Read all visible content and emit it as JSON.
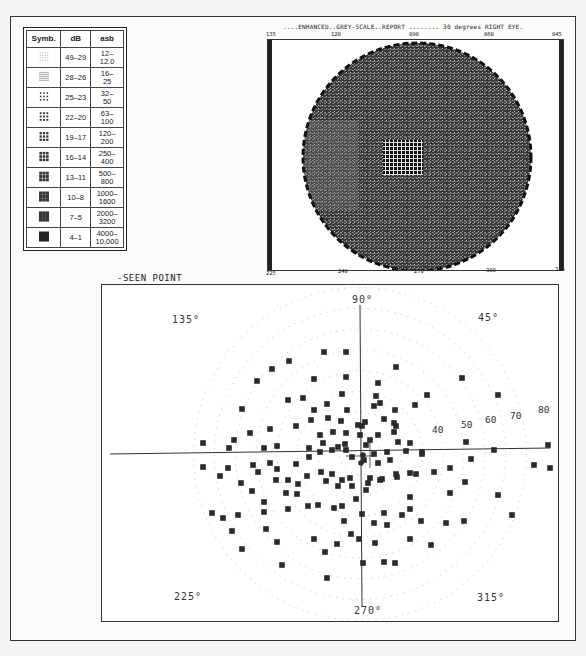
{
  "legend": {
    "headers": [
      "Symb.",
      "dB",
      "asb"
    ],
    "rows": [
      {
        "db": "49–29",
        "asb": "12–\n12.0",
        "density": 1
      },
      {
        "db": "28–26",
        "asb": "16–\n25",
        "density": 2
      },
      {
        "db": "25–23",
        "asb": "32–\n50",
        "density": 3
      },
      {
        "db": "22–20",
        "asb": "63–\n100",
        "density": 4
      },
      {
        "db": "19–17",
        "asb": "120–\n200",
        "density": 5
      },
      {
        "db": "16–14",
        "asb": "250–\n400",
        "density": 6
      },
      {
        "db": "13–11",
        "asb": "500–\n800",
        "density": 7
      },
      {
        "db": "10–8",
        "asb": "1000–\n1600",
        "density": 8
      },
      {
        "db": "7–5",
        "asb": "2000–\n3200",
        "density": 9
      },
      {
        "db": "4–1",
        "asb": "4000–\n10,000",
        "density": 10
      }
    ]
  },
  "greyscale": {
    "title": "....ENHANCED..GREY-SCALE..REPORT ........   30 degrees   RIGHT EYE.",
    "top_ticks": [
      "135",
      "120",
      "090",
      "060",
      "045"
    ],
    "bottom_ticks": [
      "225",
      "240",
      "270",
      "300",
      "315"
    ]
  },
  "status_legend": {
    "line1": "-SEEN POINT",
    "line2": "+MISSED AT  1000  I-4e",
    "line3": "●MISSED AT  3200  II-4e",
    "line4": "■MISSED AT  10000III-4e"
  },
  "colors": {
    "ink": "#222222",
    "marker": "#2a2a2a",
    "dots": "#9a9a9a"
  },
  "chart_data": {
    "type": "scatter",
    "title": "Two Zone Threshold",
    "coordinate_system": "polar",
    "angle_labels": [
      "90°",
      "45°",
      "135°",
      "225°",
      "270°",
      "315°"
    ],
    "ring_labels": [
      "40",
      "50",
      "60",
      "70",
      "80"
    ],
    "rings_deg": [
      10,
      20,
      30,
      40,
      50,
      60,
      70,
      80
    ],
    "center_px": [
      358,
      452
    ],
    "px_per_10deg": 40,
    "series": [
      {
        "name": "Missed at 10000 III-4e (square)",
        "points_px": [
          [
            322,
            350
          ],
          [
            344,
            350
          ],
          [
            287,
            359
          ],
          [
            270,
            367
          ],
          [
            255,
            379
          ],
          [
            312,
            377
          ],
          [
            344,
            375
          ],
          [
            394,
            365
          ],
          [
            425,
            393
          ],
          [
            460,
            376
          ],
          [
            496,
            393
          ],
          [
            376,
            381
          ],
          [
            374,
            394
          ],
          [
            286,
            398
          ],
          [
            240,
            407
          ],
          [
            301,
            396
          ],
          [
            312,
            408
          ],
          [
            325,
            402
          ],
          [
            340,
            392
          ],
          [
            345,
            408
          ],
          [
            372,
            404
          ],
          [
            378,
            401
          ],
          [
            393,
            408
          ],
          [
            413,
            403
          ],
          [
            392,
            421
          ],
          [
            394,
            424
          ],
          [
            382,
            417
          ],
          [
            356,
            423
          ],
          [
            360,
            424
          ],
          [
            363,
            420
          ],
          [
            339,
            419
          ],
          [
            326,
            416
          ],
          [
            309,
            418
          ],
          [
            294,
            424
          ],
          [
            268,
            427
          ],
          [
            248,
            431
          ],
          [
            232,
            438
          ],
          [
            262,
            446
          ],
          [
            275,
            444
          ],
          [
            307,
            446
          ],
          [
            321,
            441
          ],
          [
            336,
            445
          ],
          [
            343,
            442
          ],
          [
            364,
            443
          ],
          [
            368,
            438
          ],
          [
            358,
            433
          ],
          [
            344,
            431
          ],
          [
            331,
            430
          ],
          [
            318,
            433
          ],
          [
            376,
            433
          ],
          [
            392,
            430
          ],
          [
            396,
            440
          ],
          [
            408,
            441
          ],
          [
            420,
            450
          ],
          [
            404,
            449
          ],
          [
            385,
            450
          ],
          [
            372,
            452
          ],
          [
            464,
            440
          ],
          [
            492,
            448
          ],
          [
            546,
            443
          ],
          [
            201,
            441
          ],
          [
            227,
            446
          ],
          [
            201,
            465
          ],
          [
            226,
            466
          ],
          [
            251,
            463
          ],
          [
            268,
            461
          ],
          [
            275,
            467
          ],
          [
            294,
            462
          ],
          [
            307,
            455
          ],
          [
            318,
            450
          ],
          [
            330,
            448
          ],
          [
            344,
            448
          ],
          [
            350,
            455
          ],
          [
            362,
            458
          ],
          [
            376,
            461
          ],
          [
            388,
            458
          ],
          [
            394,
            472
          ],
          [
            380,
            477
          ],
          [
            368,
            476
          ],
          [
            348,
            476
          ],
          [
            340,
            478
          ],
          [
            330,
            472
          ],
          [
            319,
            470
          ],
          [
            305,
            474
          ],
          [
            296,
            482
          ],
          [
            286,
            478
          ],
          [
            274,
            478
          ],
          [
            256,
            470
          ],
          [
            239,
            481
          ],
          [
            218,
            474
          ],
          [
            250,
            489
          ],
          [
            262,
            500
          ],
          [
            284,
            491
          ],
          [
            295,
            492
          ],
          [
            324,
            479
          ],
          [
            336,
            484
          ],
          [
            350,
            484
          ],
          [
            366,
            481
          ],
          [
            378,
            478
          ],
          [
            395,
            475
          ],
          [
            408,
            471
          ],
          [
            420,
            452
          ],
          [
            414,
            472
          ],
          [
            432,
            470
          ],
          [
            448,
            466
          ],
          [
            448,
            491
          ],
          [
            463,
            480
          ],
          [
            469,
            457
          ],
          [
            532,
            463
          ],
          [
            548,
            466
          ],
          [
            496,
            493
          ],
          [
            408,
            495
          ],
          [
            364,
            488
          ],
          [
            354,
            497
          ],
          [
            340,
            504
          ],
          [
            332,
            506
          ],
          [
            316,
            503
          ],
          [
            306,
            504
          ],
          [
            286,
            507
          ],
          [
            262,
            510
          ],
          [
            230,
            529
          ],
          [
            236,
            513
          ],
          [
            360,
            512
          ],
          [
            382,
            511
          ],
          [
            408,
            507
          ],
          [
            419,
            519
          ],
          [
            385,
            523
          ],
          [
            373,
            541
          ],
          [
            444,
            521
          ],
          [
            510,
            513
          ],
          [
            221,
            516
          ],
          [
            240,
            547
          ],
          [
            210,
            511
          ],
          [
            264,
            527
          ],
          [
            275,
            540
          ],
          [
            312,
            537
          ],
          [
            335,
            542
          ],
          [
            349,
            532
          ],
          [
            372,
            521
          ],
          [
            400,
            513
          ],
          [
            280,
            563
          ],
          [
            323,
            550
          ],
          [
            408,
            537
          ],
          [
            462,
            519
          ],
          [
            382,
            560
          ],
          [
            429,
            543
          ],
          [
            361,
            561
          ],
          [
            325,
            576
          ],
          [
            393,
            561
          ],
          [
            357,
            537
          ],
          [
            342,
            519
          ]
        ]
      },
      {
        "name": "Missed at 3200 II-4e (dot)",
        "points_px": [
          [
            361,
            453
          ],
          [
            359,
            461
          ]
        ]
      }
    ]
  }
}
